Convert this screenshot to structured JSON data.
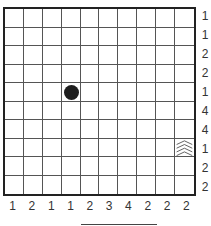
{
  "puzzle": {
    "type": "battleship",
    "rows": 10,
    "cols": 10,
    "row_clues": [
      "1",
      "1",
      "2",
      "2",
      "1",
      "4",
      "4",
      "1",
      "2",
      "2"
    ],
    "col_clues": [
      "1",
      "2",
      "1",
      "1",
      "2",
      "3",
      "4",
      "2",
      "2",
      "2"
    ],
    "given_cells": [
      {
        "row": 4,
        "col": 3,
        "symbol": "ship-dot"
      },
      {
        "row": 7,
        "col": 9,
        "symbol": "water-waves"
      }
    ]
  },
  "colors": {
    "grid_line": "#555555",
    "border": "#222222",
    "ship": "#1e1e1e",
    "text": "#333333"
  }
}
